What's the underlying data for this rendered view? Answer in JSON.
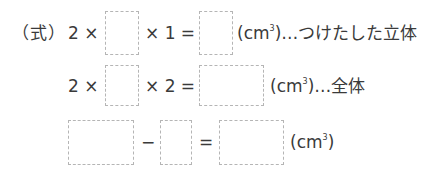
{
  "equations": {
    "label": "（式）",
    "row1": {
      "factor_a": "2 ×",
      "op_mult": "× 1 =",
      "unit_open": "(cm",
      "unit_exp": "3",
      "unit_close": ")",
      "note": "…つけたした立体"
    },
    "row2": {
      "factor_a": "2 ×",
      "op_mult": "× 2 =",
      "unit_open": "(cm",
      "unit_exp": "3",
      "unit_close": ")",
      "note": "…全体"
    },
    "row3": {
      "minus": "−",
      "equals": "=",
      "unit_open": "(cm",
      "unit_exp": "3",
      "unit_close": ")"
    }
  },
  "answer_boxes": [
    {
      "id": "box1",
      "value": ""
    },
    {
      "id": "box2",
      "value": ""
    },
    {
      "id": "box3",
      "value": ""
    },
    {
      "id": "box4",
      "value": ""
    },
    {
      "id": "box5",
      "value": ""
    },
    {
      "id": "box6",
      "value": ""
    },
    {
      "id": "box7",
      "value": ""
    }
  ],
  "colors": {
    "text": "#3a3a3a",
    "box_border": "#b5b5b5"
  }
}
